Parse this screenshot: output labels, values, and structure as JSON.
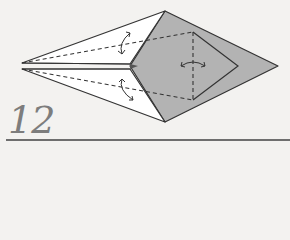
{
  "step": {
    "number": "12"
  },
  "colors": {
    "paper_front": "#ffffff",
    "paper_back": "#b3b3b3",
    "line": "#333333",
    "step_text": "#7d7d7d",
    "rule": "#6e6e6e"
  },
  "symbols": [
    {
      "type": "valley-fold-line",
      "label": "dashed fold line upper-left flap"
    },
    {
      "type": "valley-fold-line",
      "label": "dashed fold line lower-left flap"
    },
    {
      "type": "valley-fold-line",
      "label": "dashed vertical fold line center"
    },
    {
      "type": "fold-and-unfold-arrow",
      "label": "upper flap"
    },
    {
      "type": "fold-and-unfold-arrow",
      "label": "lower flap"
    },
    {
      "type": "fold-and-unfold-arrow",
      "label": "center"
    }
  ]
}
